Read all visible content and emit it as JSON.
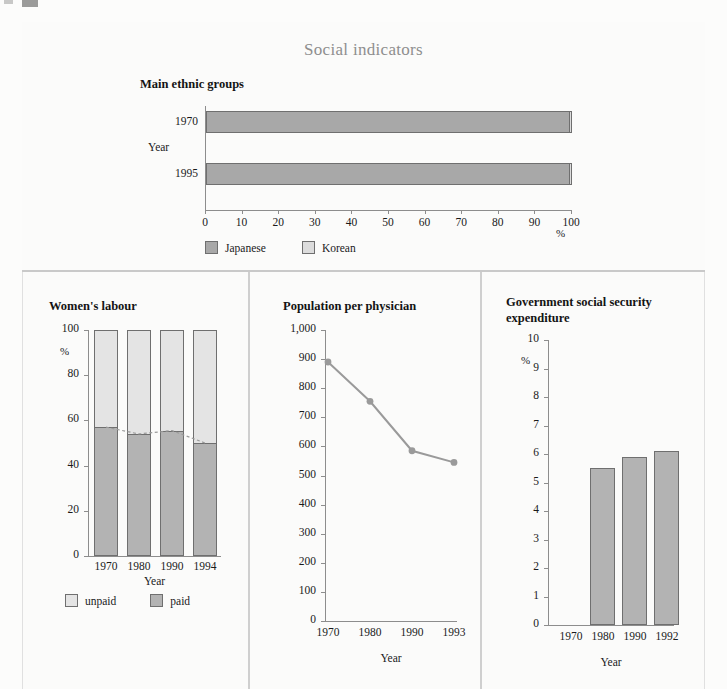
{
  "page": {
    "title": "Social indicators",
    "title_color": "#8e8e8e",
    "background": "#fcfcfb"
  },
  "colors": {
    "japanese": "#a8a8a8",
    "korean": "#dcdcdc",
    "paid": "#b3b3b3",
    "unpaid": "#e4e4e4",
    "line": "#9a9a9a",
    "axis": "#8d8d8d",
    "divider": "#c9c9c9"
  },
  "ethnic": {
    "title": "Main ethnic groups",
    "axis_name": "Year",
    "unit": "%",
    "legend": [
      {
        "label": "Japanese",
        "color": "#a8a8a8"
      },
      {
        "label": "Korean",
        "color": "#dcdcdc"
      }
    ],
    "year_labels": [
      "1970",
      "1995"
    ],
    "xticks": [
      "0",
      "10",
      "20",
      "30",
      "40",
      "50",
      "60",
      "70",
      "80",
      "90",
      "100"
    ]
  },
  "women": {
    "title": "Women's labour",
    "unit": "%",
    "axis_name": "Year",
    "yticks": [
      "0",
      "20",
      "40",
      "60",
      "80",
      "100"
    ],
    "xticks": [
      "1970",
      "1980",
      "1990",
      "1994"
    ],
    "legend": [
      {
        "label": "unpaid",
        "color": "#e4e4e4"
      },
      {
        "label": "paid",
        "color": "#b3b3b3"
      }
    ]
  },
  "physician": {
    "title": "Population per physician",
    "axis_name": "Year",
    "yticks": [
      "0",
      "100",
      "200",
      "300",
      "400",
      "500",
      "600",
      "700",
      "800",
      "900",
      "1,000"
    ],
    "xticks": [
      "1970",
      "1980",
      "1990",
      "1993"
    ]
  },
  "expenditure": {
    "title": "Government social security expenditure",
    "unit": "%",
    "axis_name": "Year",
    "yticks": [
      "0",
      "1",
      "2",
      "3",
      "4",
      "5",
      "6",
      "7",
      "8",
      "9",
      "10"
    ],
    "xticks": [
      "1970",
      "1980",
      "1990",
      "1992"
    ]
  },
  "chart_data": [
    {
      "type": "bar",
      "orientation": "horizontal",
      "title": "Main ethnic groups",
      "xlabel": "%",
      "ylabel": "Year",
      "categories": [
        "1970",
        "1995"
      ],
      "series": [
        {
          "name": "Japanese",
          "values": [
            99.4,
            99.4
          ],
          "color": "#a8a8a8"
        },
        {
          "name": "Korean",
          "values": [
            0.6,
            0.6
          ],
          "color": "#dcdcdc"
        }
      ],
      "stacked": true,
      "xlim": [
        0,
        100
      ],
      "xticks": [
        0,
        10,
        20,
        30,
        40,
        50,
        60,
        70,
        80,
        90,
        100
      ],
      "grid": false,
      "legend_position": "bottom-left"
    },
    {
      "type": "bar",
      "orientation": "vertical",
      "title": "Women's labour",
      "xlabel": "Year",
      "ylabel": "%",
      "categories": [
        "1970",
        "1980",
        "1990",
        "1994"
      ],
      "series": [
        {
          "name": "paid",
          "values": [
            57,
            54,
            55.5,
            50
          ],
          "color": "#b3b3b3"
        },
        {
          "name": "unpaid",
          "values": [
            43,
            46,
            44.5,
            50
          ],
          "color": "#e4e4e4"
        }
      ],
      "stacked": true,
      "ylim": [
        0,
        100
      ],
      "yticks": [
        0,
        20,
        40,
        60,
        80,
        100
      ],
      "annotation": "dashed trend line connecting tops of paid segments",
      "grid": false,
      "legend_position": "bottom"
    },
    {
      "type": "line",
      "title": "Population per physician",
      "xlabel": "Year",
      "ylabel": "",
      "x": [
        "1970",
        "1980",
        "1990",
        "1993"
      ],
      "values": [
        890,
        755,
        585,
        545
      ],
      "ylim": [
        0,
        1000
      ],
      "yticks": [
        0,
        100,
        200,
        300,
        400,
        500,
        600,
        700,
        800,
        900,
        1000
      ],
      "marker": "circle",
      "color": "#9a9a9a",
      "grid": false,
      "legend_position": "none"
    },
    {
      "type": "bar",
      "orientation": "vertical",
      "title": "Government social security expenditure",
      "xlabel": "Year",
      "ylabel": "%",
      "categories": [
        "1970",
        "1980",
        "1990",
        "1992"
      ],
      "values": [
        null,
        5.5,
        5.9,
        6.1
      ],
      "color": "#b3b3b3",
      "ylim": [
        0,
        10
      ],
      "yticks": [
        0,
        1,
        2,
        3,
        4,
        5,
        6,
        7,
        8,
        9,
        10
      ],
      "grid": false,
      "legend_position": "none"
    }
  ]
}
